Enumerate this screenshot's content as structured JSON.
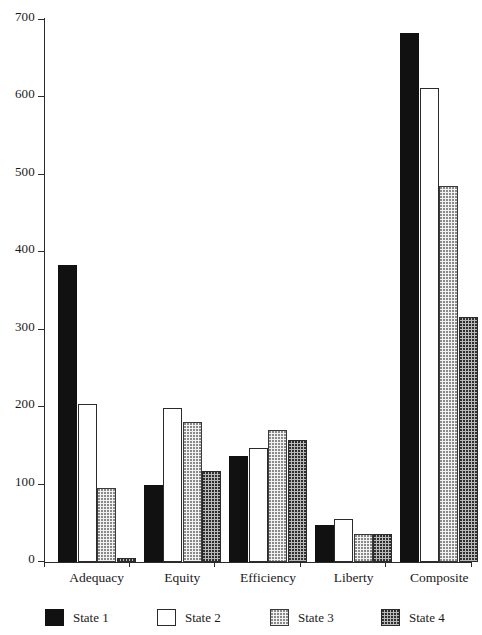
{
  "chart_data": {
    "type": "bar",
    "title": "",
    "subtitle": "",
    "xlabel": "",
    "ylabel": "",
    "categories": [
      "Adequacy",
      "Equity",
      "Efficiency",
      "Liberty",
      "Composite"
    ],
    "series": [
      {
        "name": "State 1",
        "fill": "solid-black",
        "color": "#111111",
        "values": [
          383,
          100,
          137,
          48,
          683
        ]
      },
      {
        "name": "State 2",
        "fill": "white-outline",
        "color": "#ffffff",
        "values": [
          204,
          199,
          147,
          56,
          612
        ]
      },
      {
        "name": "State 3",
        "fill": "light-dotted",
        "color": "#f2f2f2",
        "values": [
          96,
          181,
          170,
          36,
          485
        ]
      },
      {
        "name": "State 4",
        "fill": "dark-crosshatch",
        "color": "#b9b9b9",
        "values": [
          5,
          118,
          158,
          36,
          316
        ]
      }
    ],
    "ylim": [
      0,
      700
    ],
    "ytick_values": [
      0,
      100,
      200,
      300,
      400,
      500,
      600,
      700
    ],
    "ytick_labels": [
      "0",
      "100",
      "200",
      "300",
      "400",
      "500",
      "600",
      "700"
    ],
    "grid": false,
    "legend_position": "bottom",
    "legend_entries": [
      "State 1",
      "State 2",
      "State 3",
      "State 4"
    ],
    "annotations": []
  }
}
